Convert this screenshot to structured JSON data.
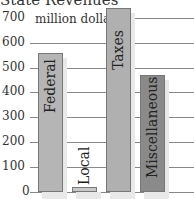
{
  "chart_data": {
    "type": "bar",
    "title": "State Revenues",
    "xlabel": "",
    "ylabel": "million dollars",
    "ylim": [
      0,
      700
    ],
    "yticks": [
      0,
      100,
      200,
      300,
      400,
      500,
      600,
      700
    ],
    "ytick_labels": [
      "0",
      "100",
      "200",
      "300",
      "400",
      "500",
      "600",
      "700 million dollars"
    ],
    "categories": [
      "Federal",
      "Local",
      "Taxes",
      "Miscellaneous"
    ],
    "values": [
      560,
      20,
      740,
      470
    ],
    "colors": [
      "#b5b5b5",
      "#c8c8c8",
      "#b0b0b0",
      "#8a8a8a"
    ],
    "grid": true,
    "legend": "none"
  },
  "labels": {
    "title": "State Revenues",
    "unit": "million dollars",
    "ticks": [
      "0",
      "100",
      "200",
      "300",
      "400",
      "500",
      "600",
      "700"
    ],
    "bars": [
      "Federal",
      "Local",
      "Taxes",
      "Miscellaneous"
    ]
  }
}
